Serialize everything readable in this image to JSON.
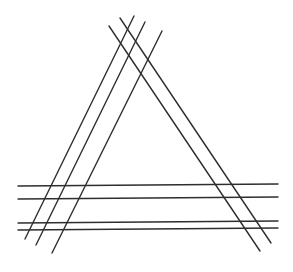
{
  "diagram": {
    "title": "",
    "background": "#ffffff",
    "stroke_color": "#2e2e2e",
    "stroke_width": 1.4,
    "groups": [
      {
        "name": "left-side-lines",
        "lines": [
          {
            "x1": 134,
            "y1": 16,
            "x2": 25,
            "y2": 239
          },
          {
            "x1": 145,
            "y1": 22,
            "x2": 36,
            "y2": 245
          },
          {
            "x1": 162,
            "y1": 31,
            "x2": 52,
            "y2": 253
          }
        ]
      },
      {
        "name": "right-side-lines",
        "lines": [
          {
            "x1": 109,
            "y1": 26,
            "x2": 260,
            "y2": 251
          },
          {
            "x1": 120,
            "y1": 18,
            "x2": 271,
            "y2": 243
          }
        ]
      },
      {
        "name": "base-lines",
        "lines": [
          {
            "x1": 18,
            "y1": 186,
            "x2": 278,
            "y2": 184
          },
          {
            "x1": 18,
            "y1": 199,
            "x2": 278,
            "y2": 197
          },
          {
            "x1": 18,
            "y1": 223,
            "x2": 278,
            "y2": 221
          },
          {
            "x1": 18,
            "y1": 230,
            "x2": 278,
            "y2": 228
          }
        ]
      }
    ]
  }
}
